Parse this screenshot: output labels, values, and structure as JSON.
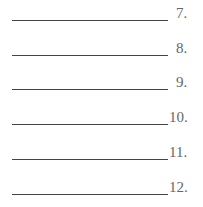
{
  "answer_lines": [
    {
      "number": "7."
    },
    {
      "number": "8."
    },
    {
      "number": "9."
    },
    {
      "number": "10."
    },
    {
      "number": "11."
    },
    {
      "number": "12."
    }
  ]
}
